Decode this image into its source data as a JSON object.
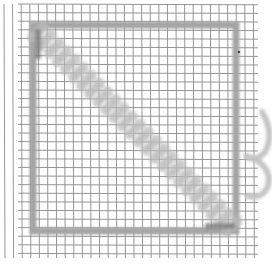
{
  "image": {
    "description": "Grid paper with a thick gray square frame and a blurred diagonal stroke from top-left to bottom-right; partial curved shape at right edge",
    "width": 274,
    "height": 268
  },
  "grid": {
    "spacing": 8.6,
    "origin_x": 4,
    "origin_y": 4,
    "x_start": 18,
    "x_end": 258,
    "y_start": 4,
    "y_end": 258,
    "line_color": "#8a8a8a",
    "line_width": 0.9
  },
  "frame": {
    "x": 33,
    "y": 25,
    "width": 203,
    "height": 206,
    "stroke": "#a5a5a5",
    "stroke_width": 7
  },
  "diagonal": {
    "x1": 38,
    "y1": 32,
    "x2": 232,
    "y2": 226,
    "light_color": "#b9b9b9",
    "dark_color": "#7d7d7d",
    "width": 16
  },
  "side_curve": {
    "color": "#c4c4c4",
    "path": "M262,112 C270,125 272,140 265,152 C258,160 250,160 246,156 M246,156 C262,160 272,172 268,186 C264,196 256,198 248,196"
  },
  "mark": {
    "x": 239,
    "y": 52,
    "color": "#444444"
  }
}
